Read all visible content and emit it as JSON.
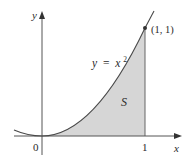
{
  "figure": {
    "function_label": "y = x",
    "function_label_prefix": "y",
    "function_label_eq": "=",
    "function_label_var": "x",
    "function_label_exp": "2",
    "region_label": "S",
    "point_label": "(1, 1)",
    "axis_x_label": "x",
    "axis_y_label": "y",
    "origin_label": "0",
    "x_tick_label": "1",
    "colors": {
      "axis": "#555555",
      "curve": "#4a4a4a",
      "region_fill": "#d6d6d6",
      "point": "#333333",
      "text": "#2a2a2a"
    }
  }
}
